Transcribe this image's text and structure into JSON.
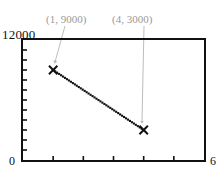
{
  "chart_data": {
    "type": "line",
    "title": "",
    "xlabel": "",
    "ylabel": "",
    "xlim": [
      0,
      6
    ],
    "ylim": [
      0,
      12000
    ],
    "grid": false,
    "legend": false,
    "x_tick_labels": [
      "0",
      "6"
    ],
    "y_tick_labels": [
      "0",
      "12000"
    ],
    "x_minor_tick_count": 5,
    "y_minor_tick_count": 11,
    "series": [
      {
        "name": "series-1",
        "marker": "x",
        "line_style": "dotted",
        "color": "#111111",
        "x": [
          1,
          4
        ],
        "values": [
          9000,
          3000
        ],
        "points": [
          {
            "x": 1,
            "y": 9000
          },
          {
            "x": 4,
            "y": 3000
          }
        ]
      }
    ],
    "annotations": [
      {
        "label": "(1, 9000)",
        "target_x": 1,
        "target_y": 9000
      },
      {
        "label": "(4, 3000)",
        "target_x": 4,
        "target_y": 3000
      }
    ]
  },
  "axes": {
    "y_max_label": "12000",
    "y_min_label": "0",
    "x_max_label": "6"
  },
  "colors": {
    "frame": "#111111",
    "data": "#111111",
    "annotation": "#9a9a9a",
    "background": "#ffffff"
  }
}
